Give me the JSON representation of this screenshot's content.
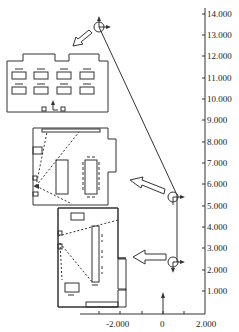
{
  "figure": {
    "type": "trajectory-with-floorplans",
    "y_axis": {
      "ticks": [
        "1.000",
        "2.000",
        "3.000",
        "4.000",
        "5.000",
        "6.000",
        "7.000",
        "8.000",
        "9.000",
        "10.000",
        "11.000",
        "12.000",
        "13.000",
        "14.000"
      ]
    },
    "x_axis": {
      "ticks": [
        "-2.000",
        "0",
        "2.000"
      ]
    },
    "poses": [
      {
        "name": "pose-top",
        "x": -2.0,
        "y": 13.5
      },
      {
        "name": "pose-middle",
        "x": 0.9,
        "y": 5.5
      },
      {
        "name": "pose-bottom",
        "x": 0.9,
        "y": 2.8
      }
    ],
    "floorplans": [
      {
        "name": "floorplan-top",
        "desc": "room with 8 desks in 2 rows"
      },
      {
        "name": "floorplan-middle",
        "desc": "room with two tables and camera field of view"
      },
      {
        "name": "floorplan-bottom",
        "desc": "room with long bench and camera field of view"
      }
    ],
    "colors": {
      "line": "#333333",
      "background": "#ffffff"
    }
  }
}
